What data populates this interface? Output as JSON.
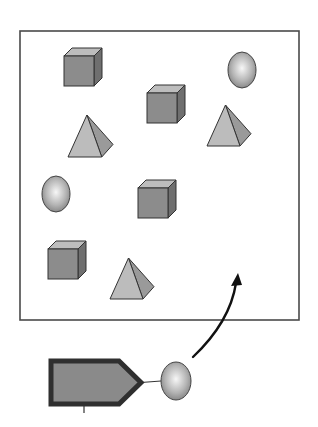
{
  "diagram": {
    "colors": {
      "frame": "#4a4a4a",
      "cube_front": "#8c8c8c",
      "cube_top": "#bdbdbd",
      "cube_side": "#6f6f6f",
      "pyramid_front": "#bcbcbc",
      "pyramid_side": "#9a9a9a",
      "sphere_light": "#f2f2f2",
      "sphere_dark": "#8a8a8a",
      "pentagon_fill": "#8a8a8a",
      "pentagon_border": "#2f2f2f",
      "arrow": "#111111"
    },
    "container": {
      "x": 20,
      "y": 31,
      "width": 279,
      "height": 289
    },
    "shapes": [
      {
        "type": "cube",
        "x": 64,
        "y": 48,
        "size": 30
      },
      {
        "type": "sphere",
        "cx": 242,
        "cy": 70,
        "rx": 14,
        "ry": 18
      },
      {
        "type": "cube",
        "x": 147,
        "y": 85,
        "size": 30
      },
      {
        "type": "pyramid",
        "x": 68,
        "y": 115,
        "w": 45,
        "h": 42
      },
      {
        "type": "pyramid",
        "x": 207,
        "y": 105,
        "w": 44,
        "h": 41
      },
      {
        "type": "sphere",
        "cx": 56,
        "cy": 194,
        "rx": 14,
        "ry": 18
      },
      {
        "type": "cube",
        "x": 138,
        "y": 180,
        "size": 30
      },
      {
        "type": "cube",
        "x": 48,
        "y": 241,
        "size": 30
      },
      {
        "type": "pyramid",
        "x": 110,
        "y": 258,
        "w": 44,
        "h": 41
      }
    ],
    "agent": {
      "pentagon": {
        "x": 51,
        "y": 361,
        "w": 90,
        "h": 43
      },
      "sphere": {
        "cx": 176,
        "cy": 381,
        "rx": 15,
        "ry": 19
      },
      "stem": {
        "x": 84,
        "y1": 404,
        "y2": 413
      }
    },
    "arrow": {
      "from": [
        193,
        357
      ],
      "to": [
        238,
        273
      ]
    }
  }
}
